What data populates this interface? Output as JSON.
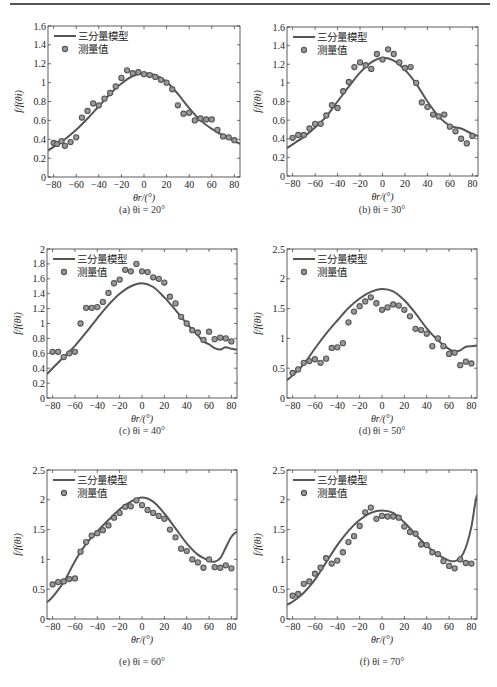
{
  "legend": {
    "model_label": "三分量模型",
    "measured_label": "测量值"
  },
  "axis": {
    "ylabel": "f/f(θi)",
    "xlabel": "θr/(°)"
  },
  "colors": {
    "line": "#555555",
    "marker_stroke": "#555555",
    "marker_fill": "#9a9a9a",
    "axes": "#333333"
  },
  "chart_data": [
    {
      "type": "line+scatter",
      "caption": "(a) θi = 20°",
      "title": "",
      "xlabel": "θr/(°)",
      "ylabel": "f/f(θi)",
      "xlim": [
        -85,
        85
      ],
      "ylim": [
        0,
        1.6
      ],
      "xticks": [
        -80,
        -60,
        -40,
        -20,
        0,
        20,
        40,
        60,
        80
      ],
      "yticks": [
        0,
        0.2,
        0.4,
        0.6,
        0.8,
        1,
        1.2,
        1.4,
        1.6
      ],
      "ytick_labels": [
        "0",
        "0.2",
        "0.4",
        "0.6",
        "0.8",
        "1",
        "1.2",
        "1.4",
        "1.6"
      ],
      "legend_position": "upper-left",
      "series": [
        {
          "name": "三分量模型",
          "kind": "line",
          "x": [
            -85,
            -80,
            -70,
            -60,
            -50,
            -40,
            -30,
            -20,
            -10,
            0,
            10,
            20,
            30,
            40,
            50,
            60,
            70,
            80,
            85
          ],
          "y": [
            0.28,
            0.32,
            0.4,
            0.5,
            0.62,
            0.75,
            0.88,
            0.99,
            1.07,
            1.1,
            1.08,
            1.01,
            0.88,
            0.73,
            0.6,
            0.51,
            0.44,
            0.38,
            0.35
          ]
        },
        {
          "name": "测量值",
          "kind": "scatter",
          "x": [
            -80,
            -77,
            -73,
            -70,
            -65,
            -60,
            -55,
            -50,
            -45,
            -40,
            -35,
            -30,
            -25,
            -20,
            -15,
            -10,
            -5,
            0,
            5,
            10,
            15,
            20,
            25,
            30,
            35,
            40,
            45,
            50,
            55,
            60,
            65,
            70,
            75,
            80
          ],
          "y": [
            0.36,
            0.35,
            0.38,
            0.33,
            0.37,
            0.42,
            0.63,
            0.7,
            0.78,
            0.76,
            0.83,
            0.89,
            0.96,
            1.05,
            1.13,
            1.1,
            1.11,
            1.09,
            1.08,
            1.06,
            1.03,
            1.0,
            0.93,
            0.76,
            0.67,
            0.68,
            0.6,
            0.62,
            0.61,
            0.61,
            0.5,
            0.43,
            0.42,
            0.39
          ]
        }
      ]
    },
    {
      "type": "line+scatter",
      "caption": "(b) θi = 30°",
      "title": "",
      "xlabel": "θr/(°)",
      "ylabel": "f/f(θi)",
      "xlim": [
        -85,
        85
      ],
      "ylim": [
        0,
        1.6
      ],
      "xticks": [
        -80,
        -60,
        -40,
        -20,
        0,
        20,
        40,
        60,
        80
      ],
      "yticks": [
        0,
        0.2,
        0.4,
        0.6,
        0.8,
        1,
        1.2,
        1.4,
        1.6
      ],
      "ytick_labels": [
        "0",
        "0.2",
        "0.4",
        "0.6",
        "0.8",
        "1",
        "1.2",
        "1.4",
        "1.6"
      ],
      "legend_position": "upper-left",
      "series": [
        {
          "name": "三分量模型",
          "kind": "line",
          "x": [
            -85,
            -80,
            -70,
            -60,
            -50,
            -40,
            -30,
            -20,
            -10,
            0,
            10,
            20,
            30,
            40,
            50,
            60,
            70,
            80,
            85
          ],
          "y": [
            0.3,
            0.34,
            0.42,
            0.52,
            0.64,
            0.8,
            0.96,
            1.11,
            1.22,
            1.27,
            1.24,
            1.14,
            0.99,
            0.8,
            0.64,
            0.54,
            0.51,
            0.45,
            0.43
          ]
        },
        {
          "name": "测量值",
          "kind": "scatter",
          "x": [
            -80,
            -75,
            -70,
            -65,
            -60,
            -55,
            -50,
            -45,
            -40,
            -35,
            -30,
            -25,
            -20,
            -15,
            -10,
            -5,
            0,
            5,
            10,
            15,
            20,
            25,
            30,
            35,
            40,
            45,
            50,
            55,
            60,
            65,
            70,
            75,
            80
          ],
          "y": [
            0.41,
            0.44,
            0.44,
            0.51,
            0.56,
            0.56,
            0.65,
            0.76,
            0.73,
            0.91,
            1.01,
            1.17,
            1.22,
            1.19,
            1.15,
            1.31,
            1.25,
            1.36,
            1.31,
            1.22,
            1.16,
            1.17,
            1.0,
            0.79,
            0.74,
            0.66,
            0.64,
            0.66,
            0.53,
            0.48,
            0.4,
            0.35,
            0.43
          ]
        }
      ]
    },
    {
      "type": "line+scatter",
      "caption": "(c) θi = 40°",
      "title": "",
      "xlabel": "θr/(°)",
      "ylabel": "f/f(θi)",
      "xlim": [
        -85,
        85
      ],
      "ylim": [
        0,
        2
      ],
      "xticks": [
        -80,
        -60,
        -40,
        -20,
        0,
        20,
        40,
        60,
        80
      ],
      "yticks": [
        0,
        0.2,
        0.4,
        0.6,
        0.8,
        1,
        1.2,
        1.4,
        1.6,
        1.8,
        2
      ],
      "ytick_labels": [
        "0",
        "0.2",
        "0.4",
        "0.6",
        "0.8",
        "1",
        "1.2",
        "1.4",
        "1.6",
        "1.8",
        "2"
      ],
      "legend_position": "upper-left",
      "series": [
        {
          "name": "三分量模型",
          "kind": "line",
          "x": [
            -85,
            -80,
            -70,
            -60,
            -50,
            -40,
            -30,
            -20,
            -10,
            0,
            10,
            20,
            30,
            40,
            50,
            55,
            60,
            65,
            70,
            75,
            80,
            85
          ],
          "y": [
            0.32,
            0.4,
            0.55,
            0.7,
            0.88,
            1.07,
            1.25,
            1.4,
            1.5,
            1.54,
            1.49,
            1.35,
            1.18,
            1.0,
            0.84,
            0.76,
            0.72,
            0.67,
            0.65,
            0.68,
            0.66,
            0.65
          ]
        },
        {
          "name": "测量值",
          "kind": "scatter",
          "x": [
            -80,
            -75,
            -70,
            -65,
            -60,
            -55,
            -50,
            -45,
            -40,
            -35,
            -30,
            -25,
            -20,
            -15,
            -10,
            -5,
            0,
            5,
            10,
            15,
            20,
            25,
            30,
            35,
            40,
            45,
            50,
            55,
            60,
            65,
            70,
            75,
            80
          ],
          "y": [
            0.62,
            0.62,
            0.55,
            0.6,
            0.62,
            1.0,
            1.21,
            1.21,
            1.22,
            1.29,
            1.41,
            1.54,
            1.59,
            1.72,
            1.7,
            1.8,
            1.7,
            1.69,
            1.62,
            1.6,
            1.55,
            1.36,
            1.27,
            1.09,
            1.0,
            0.91,
            0.88,
            0.78,
            0.89,
            0.79,
            0.81,
            0.8,
            0.76
          ]
        }
      ]
    },
    {
      "type": "line+scatter",
      "caption": "(d) θi = 50°",
      "title": "",
      "xlabel": "θr/(°)",
      "ylabel": "f/f(θi)",
      "xlim": [
        -85,
        85
      ],
      "ylim": [
        0,
        2.5
      ],
      "xticks": [
        -80,
        -60,
        -40,
        -20,
        0,
        20,
        40,
        60,
        80
      ],
      "yticks": [
        0,
        0.5,
        1,
        1.5,
        2,
        2.5
      ],
      "ytick_labels": [
        "0",
        "0.5",
        "1",
        "1.5",
        "2",
        "2.5"
      ],
      "legend_position": "upper-left",
      "series": [
        {
          "name": "三分量模型",
          "kind": "line",
          "x": [
            -85,
            -80,
            -70,
            -60,
            -50,
            -40,
            -30,
            -20,
            -10,
            0,
            10,
            20,
            30,
            40,
            50,
            60,
            65,
            70,
            75,
            80,
            85
          ],
          "y": [
            0.3,
            0.38,
            0.57,
            0.83,
            1.08,
            1.3,
            1.51,
            1.67,
            1.78,
            1.83,
            1.79,
            1.64,
            1.42,
            1.17,
            0.97,
            0.82,
            0.78,
            0.8,
            0.86,
            0.87,
            0.88
          ]
        },
        {
          "name": "测量值",
          "kind": "scatter",
          "x": [
            -80,
            -75,
            -70,
            -65,
            -60,
            -55,
            -50,
            -45,
            -40,
            -35,
            -30,
            -25,
            -20,
            -15,
            -10,
            -5,
            0,
            5,
            10,
            15,
            20,
            25,
            30,
            35,
            40,
            45,
            50,
            55,
            60,
            65,
            70,
            75,
            80
          ],
          "y": [
            0.42,
            0.48,
            0.59,
            0.62,
            0.65,
            0.59,
            0.66,
            0.84,
            0.85,
            0.92,
            1.27,
            1.45,
            1.54,
            1.62,
            1.69,
            1.59,
            1.48,
            1.52,
            1.57,
            1.55,
            1.48,
            1.37,
            1.16,
            1.14,
            1.08,
            0.87,
            1.0,
            0.87,
            0.74,
            0.76,
            0.55,
            0.61,
            0.58
          ]
        }
      ]
    },
    {
      "type": "line+scatter",
      "caption": "(e) θi = 60°",
      "title": "",
      "xlabel": "θr/(°)",
      "ylabel": "f/f(θi)",
      "xlim": [
        -85,
        85
      ],
      "ylim": [
        0,
        2.5
      ],
      "xticks": [
        -80,
        -60,
        -40,
        -20,
        0,
        20,
        40,
        60,
        80
      ],
      "yticks": [
        0,
        0.5,
        1,
        1.5,
        2,
        2.5
      ],
      "ytick_labels": [
        "0",
        "0.5",
        "1",
        "1.5",
        "2",
        "2.5"
      ],
      "legend_position": "upper-left",
      "series": [
        {
          "name": "三分量模型",
          "kind": "line",
          "x": [
            -85,
            -80,
            -70,
            -60,
            -50,
            -40,
            -30,
            -20,
            -10,
            0,
            10,
            20,
            30,
            40,
            50,
            60,
            65,
            70,
            75,
            80,
            85
          ],
          "y": [
            0.28,
            0.37,
            0.62,
            0.97,
            1.26,
            1.47,
            1.66,
            1.84,
            1.97,
            2.04,
            1.97,
            1.77,
            1.52,
            1.27,
            1.08,
            0.98,
            0.96,
            1.02,
            1.2,
            1.38,
            1.47
          ]
        },
        {
          "name": "测量值",
          "kind": "scatter",
          "x": [
            -80,
            -75,
            -70,
            -65,
            -60,
            -55,
            -50,
            -45,
            -40,
            -35,
            -30,
            -25,
            -20,
            -15,
            -10,
            -5,
            0,
            5,
            10,
            15,
            20,
            25,
            30,
            35,
            40,
            45,
            50,
            55,
            60,
            65,
            70,
            75,
            80
          ],
          "y": [
            0.58,
            0.62,
            0.63,
            0.67,
            0.68,
            1.13,
            1.29,
            1.4,
            1.44,
            1.49,
            1.57,
            1.7,
            1.78,
            1.88,
            1.89,
            1.99,
            1.91,
            1.83,
            1.78,
            1.73,
            1.68,
            1.5,
            1.37,
            1.18,
            1.14,
            1.0,
            0.95,
            0.86,
            1.0,
            0.87,
            0.86,
            0.9,
            0.85
          ]
        }
      ]
    },
    {
      "type": "line+scatter",
      "caption": "(f) θi = 70°",
      "title": "",
      "xlabel": "θr/(°)",
      "ylabel": "f/f(θi)",
      "xlim": [
        -85,
        85
      ],
      "ylim": [
        0,
        2.5
      ],
      "xticks": [
        -80,
        -60,
        -40,
        -20,
        0,
        20,
        40,
        60,
        80
      ],
      "yticks": [
        0,
        0.5,
        1,
        1.5,
        2,
        2.5
      ],
      "ytick_labels": [
        "0",
        "0.5",
        "1",
        "1.5",
        "2",
        "2.5"
      ],
      "legend_position": "upper-left",
      "series": [
        {
          "name": "三分量模型",
          "kind": "line",
          "x": [
            -85,
            -80,
            -70,
            -60,
            -50,
            -40,
            -30,
            -20,
            -10,
            0,
            10,
            20,
            30,
            40,
            50,
            60,
            65,
            70,
            75,
            80,
            83,
            85
          ],
          "y": [
            0.24,
            0.29,
            0.44,
            0.66,
            0.95,
            1.24,
            1.48,
            1.66,
            1.78,
            1.82,
            1.78,
            1.62,
            1.42,
            1.23,
            1.08,
            0.98,
            0.97,
            1.02,
            1.2,
            1.55,
            1.9,
            2.08
          ]
        },
        {
          "name": "测量值",
          "kind": "scatter",
          "x": [
            -80,
            -75,
            -70,
            -65,
            -60,
            -55,
            -50,
            -45,
            -40,
            -35,
            -30,
            -25,
            -20,
            -15,
            -10,
            -5,
            0,
            5,
            10,
            15,
            20,
            25,
            30,
            35,
            40,
            45,
            50,
            55,
            60,
            65,
            70,
            75,
            80
          ],
          "y": [
            0.39,
            0.42,
            0.59,
            0.63,
            0.76,
            0.86,
            1.02,
            0.93,
            0.98,
            1.12,
            1.29,
            1.39,
            1.56,
            1.79,
            1.87,
            1.68,
            1.73,
            1.72,
            1.72,
            1.7,
            1.55,
            1.46,
            1.43,
            1.25,
            1.24,
            1.12,
            1.09,
            0.97,
            0.89,
            0.85,
            1.0,
            0.94,
            0.93
          ]
        }
      ]
    }
  ]
}
